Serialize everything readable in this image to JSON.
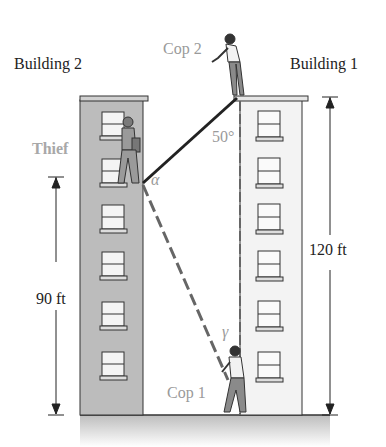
{
  "labels": {
    "building2": "Building 2",
    "building1": "Building 1",
    "cop2": "Cop 2",
    "cop1": "Cop 1",
    "thief": "Thief",
    "height_building2": "90 ft",
    "height_building1": "120 ft",
    "angle_top": "50°",
    "angle_alpha": "α",
    "angle_gamma": "γ"
  },
  "colors": {
    "building_fill_dark": "#b8b8b8",
    "building_fill_light": "#f2f2f2",
    "ground": "#cfcfcf",
    "line": "#222222",
    "dashed_line": "#666666",
    "gray_text": "#9a9a9a"
  },
  "geometry": {
    "building2_height_ft": 90,
    "building1_height_ft": 120,
    "angle_at_cop2_deg": 50,
    "windows_building2": 6,
    "windows_building1": 6
  }
}
